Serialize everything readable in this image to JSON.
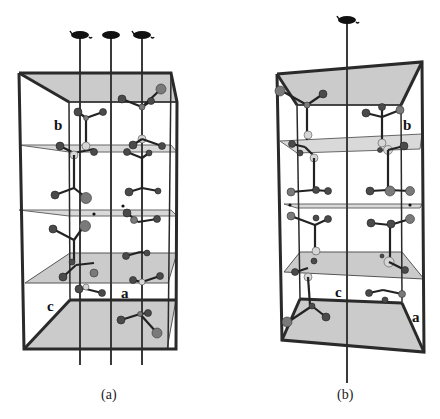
{
  "figure": {
    "panels": [
      {
        "id": "a",
        "caption": "(a)",
        "axis_labels": {
          "a": "a",
          "b": "b",
          "c": "c"
        },
        "screw_axis_count": 3,
        "symmetry_symbol": "2-fold screw axis"
      },
      {
        "id": "b",
        "caption": "(b)",
        "axis_labels": {
          "a": "a",
          "b": "b",
          "c": "c"
        },
        "screw_axis_count": 1,
        "symmetry_symbol": "2-fold screw axis"
      }
    ],
    "colors": {
      "frame": "#2a2a2a",
      "plane": "#c2c2c2",
      "atom_dark": "#4a4a4a",
      "atom_light": "#d6d6d6",
      "background": "#ffffff"
    }
  }
}
